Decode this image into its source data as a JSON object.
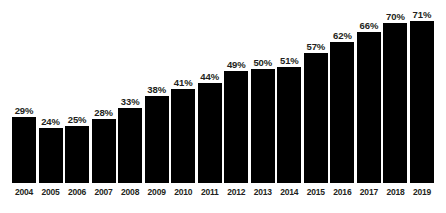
{
  "chart_data": {
    "type": "bar",
    "title": "",
    "subtitle": "",
    "xlabel": "",
    "ylabel": "",
    "ylim": [
      0,
      80
    ],
    "grid": false,
    "legend": "none",
    "value_suffix": "%",
    "categories": [
      "2004",
      "2005",
      "2006",
      "2007",
      "2008",
      "2009",
      "2010",
      "2011",
      "2012",
      "2013",
      "2014",
      "2015",
      "2016",
      "2017",
      "2018",
      "2019"
    ],
    "values": [
      29,
      24,
      25,
      28,
      33,
      38,
      41,
      44,
      49,
      50,
      51,
      57,
      62,
      66,
      70,
      71
    ],
    "value_labels": [
      "29%",
      "24%",
      "25%",
      "28%",
      "33%",
      "38%",
      "41%",
      "44%",
      "49%",
      "50%",
      "51%",
      "57%",
      "62%",
      "66%",
      "70%",
      "71%"
    ],
    "bar_color": "#000000",
    "background_color": "#ffffff",
    "label_color": "#231f20"
  }
}
